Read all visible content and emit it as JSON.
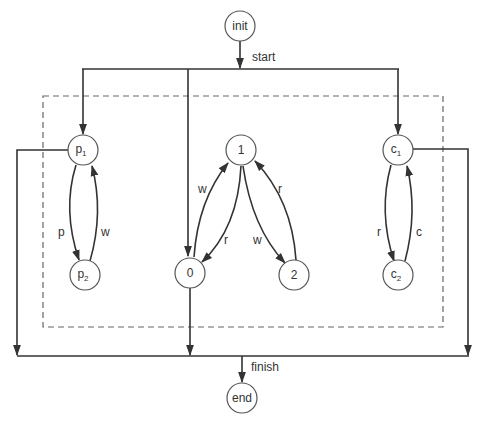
{
  "diagram": {
    "type": "state-machine / petri-style process diagram",
    "nodes": {
      "init": {
        "label": "init"
      },
      "end": {
        "label": "end"
      },
      "p1": {
        "label": "p",
        "sub": "1"
      },
      "p2": {
        "label": "p",
        "sub": "2"
      },
      "n1": {
        "label": "1"
      },
      "n0": {
        "label": "0"
      },
      "n2": {
        "label": "2"
      },
      "c1": {
        "label": "c",
        "sub": "1"
      },
      "c2": {
        "label": "c",
        "sub": "2"
      }
    },
    "edge_labels": {
      "start": "start",
      "finish": "finish",
      "p1_to_p2": "p",
      "p2_to_p1": "w",
      "n0_to_n1": "w",
      "n1_to_n0": "r",
      "n1_to_n2": "w",
      "n2_to_n1": "r",
      "c1_to_c2": "r",
      "c2_to_c1": "c"
    },
    "edges": [
      {
        "from": "init",
        "to": "start-bar",
        "label": "start"
      },
      {
        "from": "start-bar",
        "to": "p1"
      },
      {
        "from": "start-bar",
        "to": "n0"
      },
      {
        "from": "start-bar",
        "to": "c1"
      },
      {
        "from": "p1",
        "to": "p2",
        "label": "p"
      },
      {
        "from": "p2",
        "to": "p1",
        "label": "w"
      },
      {
        "from": "n0",
        "to": "n1",
        "label": "w"
      },
      {
        "from": "n1",
        "to": "n0",
        "label": "r"
      },
      {
        "from": "n1",
        "to": "n2",
        "label": "w"
      },
      {
        "from": "n2",
        "to": "n1",
        "label": "r"
      },
      {
        "from": "c1",
        "to": "c2",
        "label": "r"
      },
      {
        "from": "c2",
        "to": "c1",
        "label": "c"
      },
      {
        "from": "p1",
        "to": "finish-bar"
      },
      {
        "from": "n0",
        "to": "finish-bar"
      },
      {
        "from": "c1",
        "to": "finish-bar"
      },
      {
        "from": "finish-bar",
        "to": "end",
        "label": "finish"
      }
    ],
    "colors": {
      "stroke": "#333333",
      "node_stroke": "#555555",
      "background": "#ffffff"
    }
  }
}
